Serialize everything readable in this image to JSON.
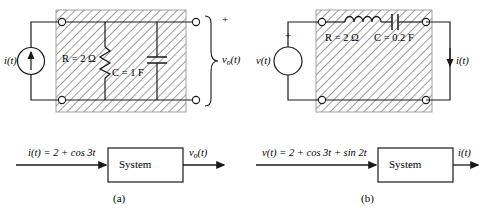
{
  "figure": {
    "caption_a": "(a)",
    "caption_b": "(b)"
  },
  "circuit_a": {
    "source_label": "i(t)",
    "source_type": "current-source",
    "resistor_label": "R = 2 Ω",
    "capacitor_label": "C = 1 F",
    "output_polarity": "+",
    "output_label": "vₒ(t)",
    "output_label_main": "v",
    "output_label_sub": "o",
    "output_label_tail": "(t)"
  },
  "circuit_b": {
    "source_label": "v(t)",
    "source_type": "voltage-source",
    "source_polarity": "+",
    "resistor_label": "R = 2 Ω",
    "capacitor_label": "C = 0.2 F",
    "output_label": "i(t)"
  },
  "block_a": {
    "input_label": "i(t) = 2 + cos 3t",
    "block_label": "System",
    "output_label_main": "v",
    "output_label_sub": "o",
    "output_label_tail": "(t)"
  },
  "block_b": {
    "input_label": "v(t) = 2 + cos 3t + sin 2t",
    "block_label": "System",
    "output_label": "i(t)"
  },
  "colors": {
    "line": "#1a1a1a",
    "hatch": "#555555",
    "background": "#ffffff"
  }
}
